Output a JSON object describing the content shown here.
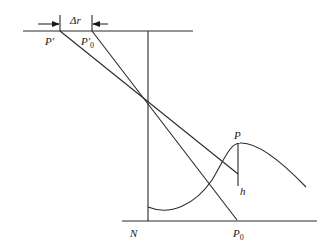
{
  "diagram": {
    "labels": {
      "p_prime": "P'",
      "p_prime_zero_base": "P'",
      "p_prime_zero_sub": "0",
      "delta_r": "Δr",
      "p": "P",
      "h": "h",
      "n": "N",
      "p_zero_base": "P",
      "p_zero_sub": "0"
    },
    "colors": {
      "stroke": "#2a2a2a",
      "text": "#1a1a1a",
      "background": "#ffffff"
    }
  }
}
